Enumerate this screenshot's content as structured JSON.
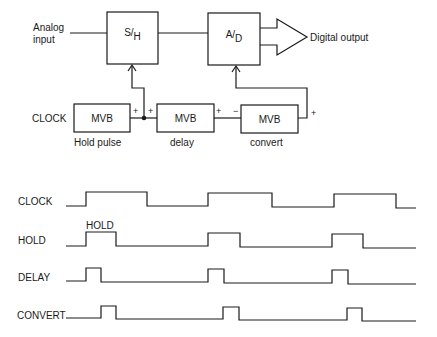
{
  "block_diagram": {
    "input_label_line1": "Analog",
    "input_label_line2": "input",
    "sample_hold": {
      "top": "S",
      "bottom": "H"
    },
    "adc": {
      "top": "A",
      "bottom": "D"
    },
    "output_label": "Digital  output",
    "clock_label": "CLOCK",
    "mvb_blocks": [
      {
        "label": "MVB",
        "caption": "Hold pulse"
      },
      {
        "label": "MVB",
        "caption": "delay"
      },
      {
        "label": "MVB",
        "caption": "convert"
      }
    ],
    "polarity": {
      "plus": "+",
      "minus": "−"
    }
  },
  "timing_diagram": {
    "signals": [
      {
        "name": "CLOCK"
      },
      {
        "name": "HOLD",
        "annotation": "HOLD"
      },
      {
        "name": "DELAY"
      },
      {
        "name": "CONVERT"
      }
    ]
  }
}
